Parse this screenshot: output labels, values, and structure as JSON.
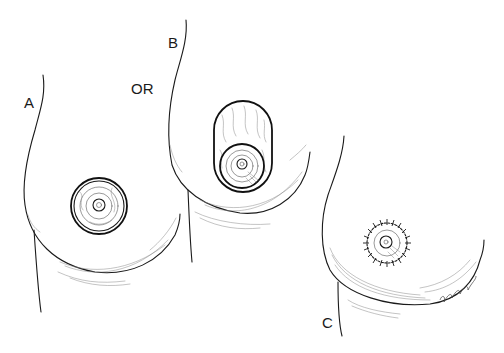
{
  "figure": {
    "panels": [
      {
        "id": "A",
        "label": "A",
        "depiction": "breast with concentric circular periareolar markings"
      },
      {
        "id": "B",
        "label": "B",
        "depiction": "breast with vertical oval skin excision around areola"
      },
      {
        "id": "C",
        "label": "C",
        "depiction": "breast with purse-string sutured circular areolar closure"
      }
    ],
    "connector_label": "OR",
    "signature": "artist signature (illegible)",
    "colors": {
      "ink": "#1a1a1a",
      "background": "#ffffff"
    }
  }
}
